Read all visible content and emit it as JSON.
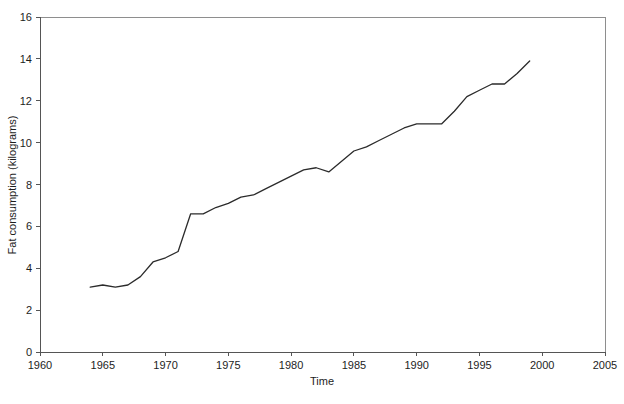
{
  "chart_data": {
    "type": "line",
    "title": "",
    "xlabel": "Time",
    "ylabel": "Fat consumption (kilograms)",
    "xlim": [
      1960,
      2005
    ],
    "ylim": [
      0,
      16
    ],
    "xticks": [
      1960,
      1965,
      1970,
      1975,
      1980,
      1985,
      1990,
      1995,
      2000,
      2005
    ],
    "yticks": [
      0,
      2,
      4,
      6,
      8,
      10,
      12,
      14,
      16
    ],
    "grid": false,
    "legend": "none",
    "line_color": "#2b2b2b",
    "series": [
      {
        "name": "Fat consumption",
        "x": [
          1964,
          1965,
          1966,
          1967,
          1968,
          1969,
          1970,
          1971,
          1972,
          1973,
          1974,
          1975,
          1976,
          1977,
          1978,
          1979,
          1980,
          1981,
          1982,
          1983,
          1984,
          1985,
          1986,
          1987,
          1988,
          1989,
          1990,
          1991,
          1992,
          1993,
          1994,
          1995,
          1996,
          1997,
          1998,
          1999
        ],
        "values": [
          3.1,
          3.2,
          3.1,
          3.2,
          3.6,
          4.3,
          4.5,
          4.8,
          6.6,
          6.6,
          6.9,
          7.1,
          7.4,
          7.5,
          7.8,
          8.1,
          8.4,
          8.7,
          8.8,
          8.6,
          9.1,
          9.6,
          9.8,
          10.1,
          10.4,
          10.7,
          10.9,
          10.9,
          10.9,
          11.5,
          12.2,
          12.5,
          12.8,
          12.8,
          13.3,
          13.9
        ]
      }
    ]
  },
  "axis_labels": {
    "x_title": "Time",
    "y_title": "Fat consumption (kilograms)"
  },
  "x_tick_labels": [
    "1960",
    "1965",
    "1970",
    "1975",
    "1980",
    "1985",
    "1990",
    "1995",
    "2000",
    "2005"
  ],
  "y_tick_labels": [
    "0",
    "2",
    "4",
    "6",
    "8",
    "10",
    "12",
    "14",
    "16"
  ]
}
